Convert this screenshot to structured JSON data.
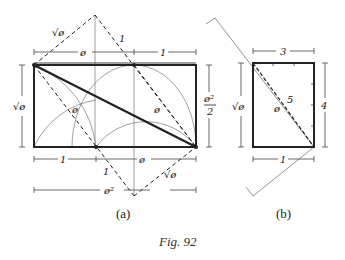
{
  "figure": {
    "caption": "Fig. 92",
    "panel_a": {
      "label": "(a)",
      "dimensions": {
        "top_left": "ø",
        "top_right": "1",
        "left_height": "√ø",
        "right_height": "ø²/2",
        "bottom_left": "1",
        "bottom_right": "ø",
        "bottom_total": "ø²"
      },
      "diagonal_labels": {
        "upper_left": "√ø",
        "upper_right": "1",
        "inner_left": "ø",
        "inner_right": "ø",
        "lower_left": "1",
        "lower_right": "√ø"
      }
    },
    "panel_b": {
      "label": "(b)",
      "dimensions": {
        "top": "3",
        "right": "4",
        "bottom": "1",
        "left": "√ø"
      },
      "diagonal_labels": {
        "hypotenuse": "5",
        "inner": "ø"
      }
    }
  },
  "colors": {
    "ink": "#222222",
    "thin_line": "#777777"
  }
}
